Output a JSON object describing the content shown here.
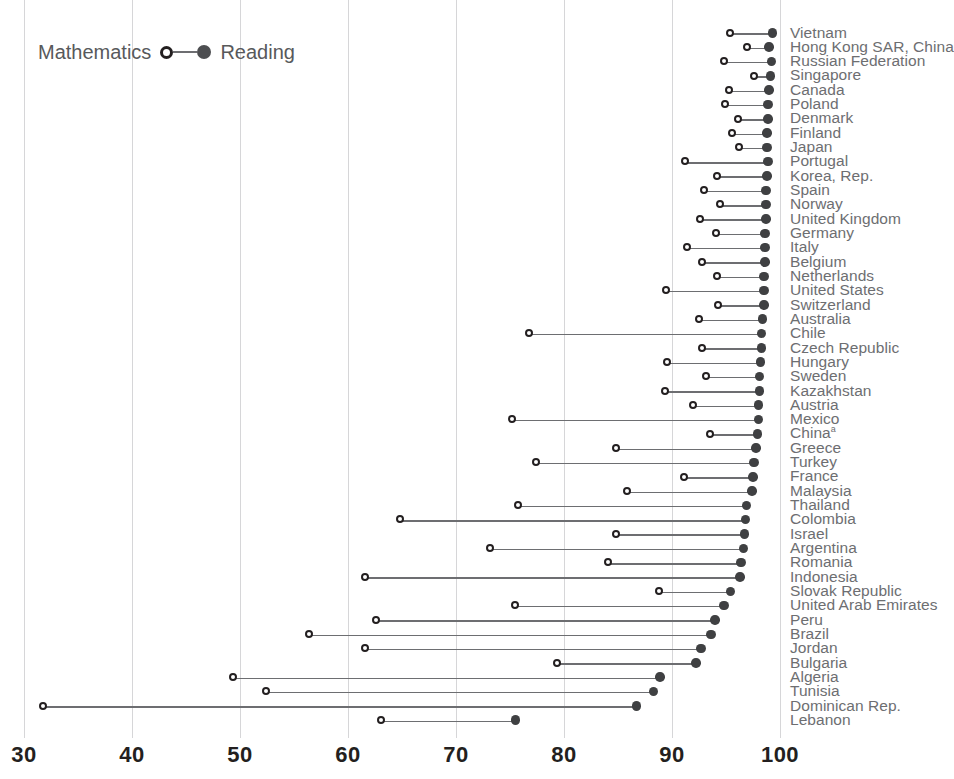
{
  "legend": {
    "left_label": "Mathematics",
    "right_label": "Reading",
    "open_marker_name": "open-circle-marker",
    "filled_marker_name": "filled-circle-marker"
  },
  "axis": {
    "ticks": [
      "30",
      "40",
      "50",
      "60",
      "70",
      "80",
      "90",
      "100"
    ],
    "min": 30,
    "max": 100
  },
  "colors": {
    "mathematics_marker": "#231f20",
    "reading_marker": "#3f4042",
    "connector": "#6d6e71",
    "gridline": "#d6d6d8",
    "label_text": "#6d6e71",
    "tick_text": "#231f20"
  },
  "chart_data": {
    "type": "scatter",
    "subtype": "dumbbell",
    "title": "",
    "xlabel": "",
    "ylabel": "",
    "xlim": [
      30,
      100
    ],
    "xticks": [
      30,
      40,
      50,
      60,
      70,
      80,
      90,
      100
    ],
    "grid": "vertical",
    "legend_position": "top-left",
    "series": [
      {
        "name": "Mathematics",
        "marker": "open-circle"
      },
      {
        "name": "Reading",
        "marker": "filled-circle"
      }
    ],
    "categories": [
      "Vietnam",
      "Hong Kong SAR, China",
      "Russian Federation",
      "Singapore",
      "Canada",
      "Poland",
      "Denmark",
      "Finland",
      "Japan",
      "Portugal",
      "Korea, Rep.",
      "Spain",
      "Norway",
      "United Kingdom",
      "Germany",
      "Italy",
      "Belgium",
      "Netherlands",
      "United States",
      "Switzerland",
      "Australia",
      "Chile",
      "Czech Republic",
      "Hungary",
      "Sweden",
      "Kazakhstan",
      "Austria",
      "Mexico",
      "China",
      "Greece",
      "Turkey",
      "France",
      "Malaysia",
      "Thailand",
      "Colombia",
      "Israel",
      "Argentina",
      "Romania",
      "Indonesia",
      "Slovak Republic",
      "United Arab Emirates",
      "Peru",
      "Brazil",
      "Jordan",
      "Bulgaria",
      "Algeria",
      "Tunisia",
      "Dominican Rep.",
      "Lebanon"
    ],
    "rows": [
      {
        "label": "Vietnam",
        "mathematics": 95.6,
        "reading": 99.3
      },
      {
        "label": "Hong Kong SAR, China",
        "mathematics": 97.2,
        "reading": 99.0
      },
      {
        "label": "Russian Federation",
        "mathematics": 95.0,
        "reading": 99.2
      },
      {
        "label": "Singapore",
        "mathematics": 97.8,
        "reading": 99.1
      },
      {
        "label": "Canada",
        "mathematics": 95.5,
        "reading": 99.0
      },
      {
        "label": "Poland",
        "mathematics": 95.1,
        "reading": 98.9
      },
      {
        "label": "Denmark",
        "mathematics": 96.3,
        "reading": 98.9
      },
      {
        "label": "Finland",
        "mathematics": 95.8,
        "reading": 98.8
      },
      {
        "label": "Japan",
        "mathematics": 96.4,
        "reading": 98.8
      },
      {
        "label": "Portugal",
        "mathematics": 91.4,
        "reading": 98.9
      },
      {
        "label": "Korea, Rep.",
        "mathematics": 94.4,
        "reading": 98.8
      },
      {
        "label": "Spain",
        "mathematics": 93.2,
        "reading": 98.7
      },
      {
        "label": "Norway",
        "mathematics": 94.7,
        "reading": 98.7
      },
      {
        "label": "United Kingdom",
        "mathematics": 92.8,
        "reading": 98.7
      },
      {
        "label": "Germany",
        "mathematics": 94.3,
        "reading": 98.6
      },
      {
        "label": "Italy",
        "mathematics": 91.6,
        "reading": 98.6
      },
      {
        "label": "Belgium",
        "mathematics": 93.0,
        "reading": 98.6
      },
      {
        "label": "Netherlands",
        "mathematics": 94.4,
        "reading": 98.5
      },
      {
        "label": "United States",
        "mathematics": 89.7,
        "reading": 98.5
      },
      {
        "label": "Switzerland",
        "mathematics": 94.5,
        "reading": 98.5
      },
      {
        "label": "Australia",
        "mathematics": 92.7,
        "reading": 98.4
      },
      {
        "label": "Chile",
        "mathematics": 77.0,
        "reading": 98.3
      },
      {
        "label": "Czech Republic",
        "mathematics": 93.0,
        "reading": 98.3
      },
      {
        "label": "Hungary",
        "mathematics": 89.8,
        "reading": 98.2
      },
      {
        "label": "Sweden",
        "mathematics": 93.4,
        "reading": 98.1
      },
      {
        "label": "Kazakhstan",
        "mathematics": 89.6,
        "reading": 98.1
      },
      {
        "label": "Austria",
        "mathematics": 92.2,
        "reading": 98.0
      },
      {
        "label": "Mexico",
        "mathematics": 75.4,
        "reading": 98.0
      },
      {
        "label": "China",
        "mathematics": 93.7,
        "reading": 97.9
      },
      {
        "label": "Greece",
        "mathematics": 85.0,
        "reading": 97.8
      },
      {
        "label": "Turkey",
        "mathematics": 77.6,
        "reading": 97.6
      },
      {
        "label": "France",
        "mathematics": 91.3,
        "reading": 97.5
      },
      {
        "label": "Malaysia",
        "mathematics": 86.1,
        "reading": 97.4
      },
      {
        "label": "Thailand",
        "mathematics": 76.0,
        "reading": 96.9
      },
      {
        "label": "Colombia",
        "mathematics": 65.0,
        "reading": 96.8
      },
      {
        "label": "Israel",
        "mathematics": 85.0,
        "reading": 96.7
      },
      {
        "label": "Argentina",
        "mathematics": 73.4,
        "reading": 96.6
      },
      {
        "label": "Romania",
        "mathematics": 84.3,
        "reading": 96.4
      },
      {
        "label": "Indonesia",
        "mathematics": 61.8,
        "reading": 96.3
      },
      {
        "label": "Slovak Republic",
        "mathematics": 89.0,
        "reading": 95.4
      },
      {
        "label": "United Arab Emirates",
        "mathematics": 75.7,
        "reading": 94.8
      },
      {
        "label": "Peru",
        "mathematics": 62.8,
        "reading": 94.0
      },
      {
        "label": "Brazil",
        "mathematics": 56.6,
        "reading": 93.6
      },
      {
        "label": "Jordan",
        "mathematics": 61.8,
        "reading": 92.7
      },
      {
        "label": "Bulgaria",
        "mathematics": 79.6,
        "reading": 92.2
      },
      {
        "label": "Algeria",
        "mathematics": 49.6,
        "reading": 88.9
      },
      {
        "label": "Tunisia",
        "mathematics": 52.6,
        "reading": 88.3
      },
      {
        "label": "Dominican Rep.",
        "mathematics": 32.0,
        "reading": 86.7
      },
      {
        "label": "Lebanon",
        "mathematics": 63.3,
        "reading": 75.5
      }
    ]
  }
}
